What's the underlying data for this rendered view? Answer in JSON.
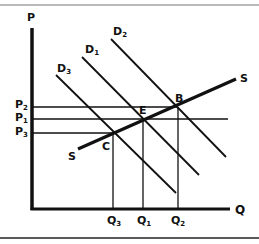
{
  "diagram": {
    "type": "supply-demand",
    "axes": {
      "y_label": "P",
      "x_label": "Q"
    },
    "curves": {
      "supply": {
        "label": "S"
      },
      "demand": [
        {
          "id": "D1",
          "label": "D",
          "sub": "1"
        },
        {
          "id": "D2",
          "label": "D",
          "sub": "2"
        },
        {
          "id": "D3",
          "label": "D",
          "sub": "3"
        }
      ]
    },
    "points": [
      {
        "label": "B"
      },
      {
        "label": "E"
      },
      {
        "label": "C"
      }
    ],
    "price_levels": [
      {
        "label": "P",
        "sub": "2"
      },
      {
        "label": "P",
        "sub": "1"
      },
      {
        "label": "P",
        "sub": "3"
      }
    ],
    "quantity_levels": [
      {
        "label": "Q",
        "sub": "3"
      },
      {
        "label": "Q",
        "sub": "1"
      },
      {
        "label": "Q",
        "sub": "2"
      }
    ],
    "colors": {
      "line": "#111111",
      "border": "#555555",
      "background": "#ffffff"
    }
  }
}
